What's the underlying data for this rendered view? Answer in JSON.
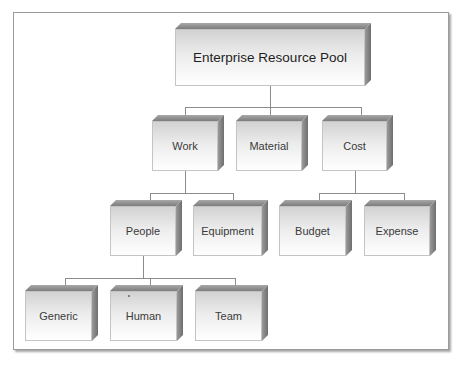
{
  "diagram": {
    "type": "hierarchy",
    "root": {
      "label": "Enterprise Resource Pool",
      "children": [
        {
          "label": "Work",
          "children": [
            {
              "label": "People",
              "children": [
                {
                  "label": "Generic"
                },
                {
                  "label": "Human"
                },
                {
                  "label": "Team"
                }
              ]
            },
            {
              "label": "Equipment"
            }
          ]
        },
        {
          "label": "Material"
        },
        {
          "label": "Cost",
          "children": [
            {
              "label": "Budget"
            },
            {
              "label": "Expense"
            }
          ]
        }
      ]
    }
  },
  "nodes": {
    "root": "Enterprise Resource Pool",
    "work": "Work",
    "material": "Material",
    "cost": "Cost",
    "people": "People",
    "equipment": "Equipment",
    "budget": "Budget",
    "expense": "Expense",
    "generic": "Generic",
    "human": "Human",
    "team": "Team"
  },
  "colors": {
    "box_top": "#8a8a8a",
    "box_side": "#7c7c7c",
    "box_front_top": "#d2d2d2",
    "box_front_bottom": "#ffffff",
    "connector": "#8c8c8c",
    "frame_border": "#9a9a9a"
  }
}
